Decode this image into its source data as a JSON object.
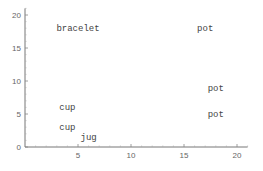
{
  "chart_data": {
    "type": "scatter",
    "title": "",
    "xlabel": "",
    "ylabel": "",
    "xlim": [
      0,
      21
    ],
    "ylim": [
      0,
      21
    ],
    "grid": false,
    "legend": null,
    "x_ticks": [
      5,
      10,
      15,
      20
    ],
    "y_ticks": [
      0,
      5,
      10,
      15,
      20
    ],
    "points": [
      {
        "label": "bracelet",
        "x": 5,
        "y": 18
      },
      {
        "label": "pot",
        "x": 17,
        "y": 18
      },
      {
        "label": "pot",
        "x": 18,
        "y": 9
      },
      {
        "label": "pot",
        "x": 18,
        "y": 5
      },
      {
        "label": "cup",
        "x": 4,
        "y": 6
      },
      {
        "label": "cup",
        "x": 4,
        "y": 3
      },
      {
        "label": "jug",
        "x": 6,
        "y": 1.5
      }
    ],
    "marker": "text-label"
  },
  "colors": {
    "axis": "#777777",
    "text": "#444444",
    "tick_text": "#666666"
  }
}
